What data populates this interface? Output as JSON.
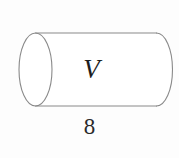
{
  "figure": {
    "kind": "cylinder-diagram",
    "background_color": "#fdfdfd",
    "stroke_color": "#8a8a8a",
    "stroke_width": 1,
    "labels": {
      "volume": "V",
      "length": "8"
    },
    "label_colors": {
      "volume": "#1d1d1d",
      "length": "#2a2a2a"
    },
    "geometry": {
      "left_ellipse": {
        "cx": 35.5,
        "cy": 69.5,
        "rx": 16.5,
        "ry": 36.5,
        "full_outline": true
      },
      "right_arc": {
        "cx": 156.5,
        "cy": 69.5,
        "rx": 16.0,
        "ry": 36.5,
        "half": "right"
      },
      "top_line": {
        "x1": 35.5,
        "y1": 33.0,
        "x2": 156.5,
        "y2": 33.0
      },
      "bottom_line": {
        "x1": 35.5,
        "y1": 106.0,
        "x2": 156.5,
        "y2": 106.0
      }
    }
  }
}
